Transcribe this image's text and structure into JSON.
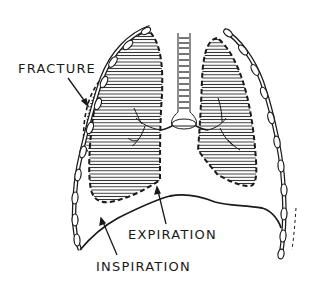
{
  "diagram": {
    "labels": {
      "fracture": "FRACTURE",
      "expiration": "EXPIRATION",
      "inspiration": "INSPIRATION"
    },
    "colors": {
      "ink": "#1a1a1a",
      "background": "#ffffff"
    }
  }
}
